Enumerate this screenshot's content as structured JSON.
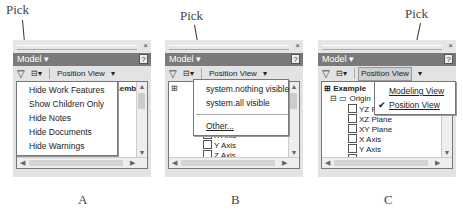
{
  "annotations": {
    "pick_label": "Pick"
  },
  "panels": [
    {
      "caption": "A",
      "title_close": "×",
      "model_label": "Model ▾",
      "help": "?",
      "toolbar": {
        "filter": "▽",
        "tree_icon": "⊟▾",
        "position_view": "Position View",
        "dropdown": "▾"
      },
      "tree": {
        "header": "Assembly.iam",
        "rows": [
          "Y Axis",
          "Z Axis"
        ]
      },
      "menu": {
        "items": [
          "Hide Work Features",
          "Show Children Only",
          "Hide Notes",
          "Hide Documents",
          "Hide Warnings"
        ]
      }
    },
    {
      "caption": "B",
      "title_close": "×",
      "model_label": "Model ▾",
      "help": "?",
      "toolbar": {
        "filter": "▽",
        "tree_icon": "⊟▾",
        "position_view": "Position View",
        "dropdown": "▾"
      },
      "tree": {
        "header": "...am",
        "rows": [
          "XY Plane",
          "X Axis",
          "Y Axis",
          "Z Axis"
        ]
      },
      "menu": {
        "items": [
          "system.nothing visible",
          "system.all visible"
        ],
        "other": "Other..."
      }
    },
    {
      "caption": "C",
      "title_close": "×",
      "model_label": "Model ▾",
      "help": "?",
      "toolbar": {
        "filter": "▽",
        "tree_icon": "⊟▾",
        "position_view": "Position View",
        "dropdown": "▾"
      },
      "tree": {
        "header": "Example",
        "origin": "Origin",
        "rows": [
          "YZ Plane",
          "XZ Plane",
          "XY Plane",
          "X Axis",
          "Y Axis",
          "Z Axis"
        ]
      },
      "menu": {
        "items": [
          "Modeling View",
          "Position View"
        ],
        "checked": "✔"
      }
    }
  ]
}
